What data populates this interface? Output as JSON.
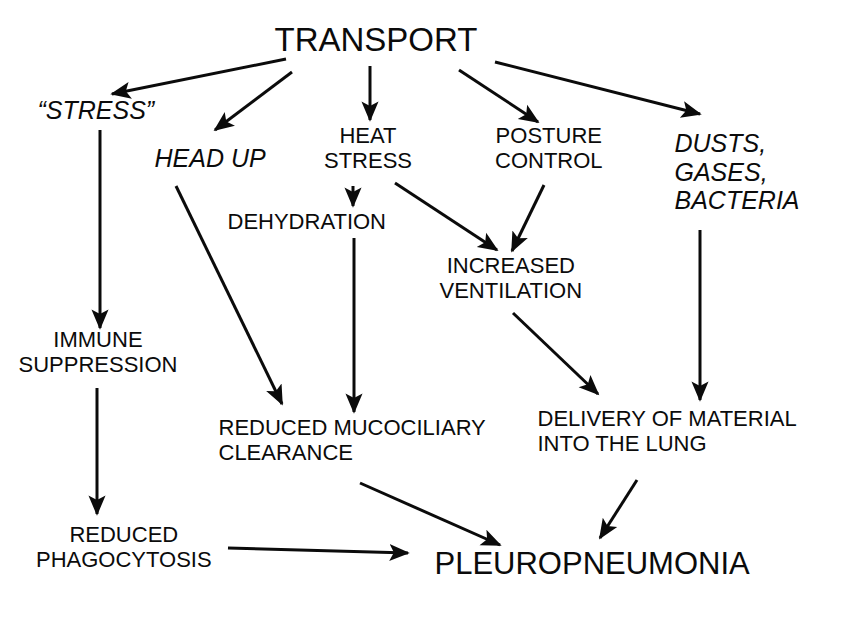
{
  "diagram": {
    "background_color": "#ffffff",
    "ink_color": "#0b0b0b",
    "nodes": [
      {
        "id": "transport",
        "label": "TRANSPORT",
        "x": 376,
        "y": 40,
        "size": 33,
        "style": "upright",
        "align": "center"
      },
      {
        "id": "stress",
        "label": "“STRESS”",
        "x": 96,
        "y": 110,
        "size": 25,
        "style": "italic",
        "align": "center"
      },
      {
        "id": "head_up",
        "label": "HEAD UP",
        "x": 210,
        "y": 158,
        "size": 25,
        "style": "italic",
        "align": "center"
      },
      {
        "id": "heat_stress",
        "label": "HEAT\nSTRESS",
        "x": 368,
        "y": 148,
        "size": 22,
        "style": "upright",
        "align": "center"
      },
      {
        "id": "posture",
        "label": "POSTURE\nCONTROL",
        "x": 549,
        "y": 148,
        "size": 22,
        "style": "upright",
        "align": "center"
      },
      {
        "id": "dusts",
        "label": "DUSTS,\nGASES,\nBACTERIA",
        "x": 737,
        "y": 172,
        "size": 25,
        "style": "italic",
        "align": "left"
      },
      {
        "id": "dehydration",
        "label": "DEHYDRATION",
        "x": 307,
        "y": 221,
        "size": 22,
        "style": "upright",
        "align": "center"
      },
      {
        "id": "increased_v",
        "label": "INCREASED\nVENTILATION",
        "x": 511,
        "y": 278,
        "size": 22,
        "style": "upright",
        "align": "center"
      },
      {
        "id": "immune",
        "label": "IMMUNE\nSUPPRESSION",
        "x": 98,
        "y": 352,
        "size": 22,
        "style": "upright",
        "align": "center"
      },
      {
        "id": "reduced_muco",
        "label": "REDUCED MUCOCILIARY\nCLEARANCE",
        "x": 352,
        "y": 440,
        "size": 22,
        "style": "upright",
        "align": "left"
      },
      {
        "id": "delivery",
        "label": "DELIVERY OF MATERIAL\nINTO THE LUNG",
        "x": 667,
        "y": 431,
        "size": 22,
        "style": "upright",
        "align": "left"
      },
      {
        "id": "phagocytosis",
        "label": "REDUCED\nPHAGOCYTOSIS",
        "x": 124,
        "y": 547,
        "size": 22,
        "style": "upright",
        "align": "center"
      },
      {
        "id": "pleuro",
        "label": "PLEUROPNEUMONIA",
        "x": 592,
        "y": 563,
        "size": 31,
        "style": "upright",
        "align": "center"
      }
    ],
    "edges": [
      {
        "id": "transport-stress",
        "from": "transport",
        "to": "stress",
        "x1": 286,
        "y1": 59,
        "x2": 112,
        "y2": 94
      },
      {
        "id": "transport-head-up",
        "from": "transport",
        "to": "head_up",
        "x1": 292,
        "y1": 72,
        "x2": 215,
        "y2": 130
      },
      {
        "id": "transport-heat-stress",
        "from": "transport",
        "to": "heat_stress",
        "x1": 370,
        "y1": 66,
        "x2": 370,
        "y2": 120
      },
      {
        "id": "transport-posture",
        "from": "transport",
        "to": "posture",
        "x1": 459,
        "y1": 70,
        "x2": 538,
        "y2": 122
      },
      {
        "id": "transport-dusts",
        "from": "transport",
        "to": "dusts",
        "x1": 495,
        "y1": 62,
        "x2": 700,
        "y2": 114
      },
      {
        "id": "stress-immune",
        "from": "stress",
        "to": "immune",
        "x1": 100,
        "y1": 130,
        "x2": 100,
        "y2": 328
      },
      {
        "id": "head-up-reduced-muco",
        "from": "head_up",
        "to": "reduced_muco",
        "x1": 176,
        "y1": 186,
        "x2": 282,
        "y2": 404
      },
      {
        "id": "heat-stress-dehydration",
        "from": "heat_stress",
        "to": "dehydration",
        "x1": 353,
        "y1": 186,
        "x2": 353,
        "y2": 206
      },
      {
        "id": "heat-stress-increased-v",
        "from": "heat_stress",
        "to": "increased_v",
        "x1": 395,
        "y1": 183,
        "x2": 497,
        "y2": 250
      },
      {
        "id": "posture-increased-v",
        "from": "posture",
        "to": "increased_v",
        "x1": 544,
        "y1": 185,
        "x2": 512,
        "y2": 251
      },
      {
        "id": "dusts-delivery",
        "from": "dusts",
        "to": "delivery",
        "x1": 700,
        "y1": 230,
        "x2": 700,
        "y2": 400
      },
      {
        "id": "dehydration-reduced-muco",
        "from": "dehydration",
        "to": "reduced_muco",
        "x1": 354,
        "y1": 238,
        "x2": 354,
        "y2": 412
      },
      {
        "id": "increased-v-delivery",
        "from": "increased_v",
        "to": "delivery",
        "x1": 513,
        "y1": 313,
        "x2": 598,
        "y2": 394
      },
      {
        "id": "immune-phagocytosis",
        "from": "immune",
        "to": "phagocytosis",
        "x1": 97,
        "y1": 388,
        "x2": 97,
        "y2": 514
      },
      {
        "id": "reduced-muco-pleuro",
        "from": "reduced_muco",
        "to": "pleuro",
        "x1": 360,
        "y1": 483,
        "x2": 500,
        "y2": 545
      },
      {
        "id": "phagocytosis-pleuro",
        "from": "phagocytosis",
        "to": "pleuro",
        "x1": 228,
        "y1": 548,
        "x2": 408,
        "y2": 553
      },
      {
        "id": "delivery-pleuro",
        "from": "delivery",
        "to": "pleuro",
        "x1": 637,
        "y1": 480,
        "x2": 600,
        "y2": 538
      }
    ]
  }
}
